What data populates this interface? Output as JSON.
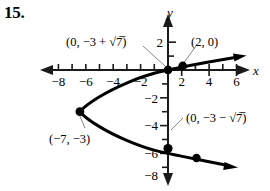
{
  "figure": {
    "problem_number": "15.",
    "axes": {
      "x_axis_label": "x",
      "y_axis_label": "y",
      "x_ticks": [
        {
          "value": -8,
          "label": "−8"
        },
        {
          "value": -6,
          "label": "−6"
        },
        {
          "value": -4,
          "label": "−4"
        },
        {
          "value": -2,
          "label": "−2"
        },
        {
          "value": 2,
          "label": "2"
        },
        {
          "value": 4,
          "label": "4"
        },
        {
          "value": 6,
          "label": "6"
        }
      ],
      "y_ticks": [
        {
          "value": 2,
          "label": "2"
        },
        {
          "value": -2,
          "label": "−2"
        },
        {
          "value": -4,
          "label": "−4"
        },
        {
          "value": -6,
          "label": "−6"
        },
        {
          "value": -8,
          "label": "−8"
        }
      ],
      "x_range": [
        -9,
        7
      ],
      "y_range": [
        -9,
        3
      ]
    },
    "annotations": [
      {
        "name": "y-intercept-upper",
        "text": "(0, −3 + √7̅)"
      },
      {
        "name": "x-intercept",
        "text": "(2, 0)"
      },
      {
        "name": "y-intercept-lower",
        "text": "(0, −3 − √7̅)"
      },
      {
        "name": "vertex",
        "text": "(−7, −3)"
      }
    ],
    "points": [
      {
        "name": "vertex-point",
        "x": -7,
        "y": -3
      },
      {
        "name": "y-intercept-upper-point",
        "x": 0,
        "y": -0.354
      },
      {
        "name": "x-intercept-point",
        "x": 2,
        "y": 0
      },
      {
        "name": "y-intercept-lower-point",
        "x": 0,
        "y": -5.646
      },
      {
        "name": "lower-branch-point",
        "x": 2,
        "y": -6
      }
    ],
    "curve": {
      "type": "parabola",
      "orientation": "opens-right",
      "vertex": [
        -7,
        -3
      ],
      "description": "x = (y+3)^2 - 7"
    },
    "colors": {
      "axis": "#1a1a1a",
      "curve": "#000000",
      "leader": "#777777",
      "background": "#ffffff"
    }
  }
}
